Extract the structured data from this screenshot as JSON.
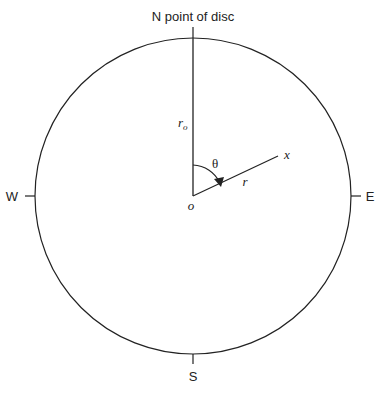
{
  "diagram": {
    "title_label": "N point of disc",
    "compass": {
      "north": "N point of disc",
      "south": "S",
      "east": "E",
      "west": "W"
    },
    "labels": {
      "radius_disc": "r",
      "radius_disc_subscript": "o",
      "angle": "θ",
      "radius_point": "r",
      "point": "x",
      "origin": "o"
    },
    "colors": {
      "stroke": "#222222",
      "background": "#ffffff"
    }
  }
}
